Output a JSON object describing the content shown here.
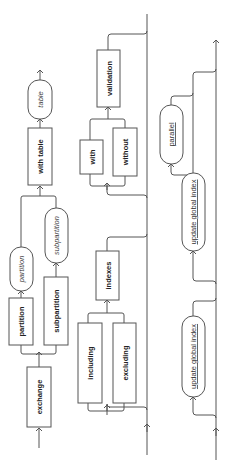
{
  "diagram": {
    "type": "syntax-railroad",
    "orientation": "rotated-90-ccw",
    "sections": [
      {
        "id": "exchange-clause",
        "nodes": [
          {
            "id": "exchange",
            "label": "exchange",
            "kind": "keyword"
          },
          {
            "id": "partition",
            "label": "partition",
            "kind": "keyword"
          },
          {
            "id": "partition-name",
            "label": "partition",
            "kind": "placeholder"
          },
          {
            "id": "subpartition",
            "label": "subpartition",
            "kind": "keyword"
          },
          {
            "id": "subpartition-name",
            "label": "subpartition",
            "kind": "placeholder"
          },
          {
            "id": "with-table",
            "label": "with table",
            "kind": "keyword"
          },
          {
            "id": "table-name",
            "label": "table",
            "kind": "placeholder"
          }
        ]
      },
      {
        "id": "index-validation-clause",
        "nodes": [
          {
            "id": "including",
            "label": "including",
            "kind": "keyword"
          },
          {
            "id": "excluding",
            "label": "excluding",
            "kind": "keyword"
          },
          {
            "id": "indexes",
            "label": "indexes",
            "kind": "keyword"
          },
          {
            "id": "with",
            "label": "with",
            "kind": "keyword"
          },
          {
            "id": "without",
            "label": "without",
            "kind": "keyword"
          },
          {
            "id": "validation",
            "label": "validation",
            "kind": "keyword"
          }
        ]
      },
      {
        "id": "global-index-clause",
        "nodes": [
          {
            "id": "update-global-index-1",
            "label": "update global index",
            "kind": "subclause"
          },
          {
            "id": "update-global-index-2",
            "label": "update global index",
            "kind": "subclause"
          },
          {
            "id": "parallel",
            "label": "parallel",
            "kind": "subclause"
          }
        ]
      }
    ]
  },
  "labels": {
    "exchange": "exchange",
    "partition_kw": "partition",
    "partition_ph": "partition",
    "subpartition_kw": "subpartition",
    "subpartition_ph": "subpartition",
    "with_table": "with table",
    "table_ph": "table",
    "including": "including",
    "excluding": "excluding",
    "indexes": "indexes",
    "with": "with",
    "without": "without",
    "validation": "validation",
    "update_global_index_1": "update global index",
    "update_global_index_2": "update global index",
    "parallel": "parallel"
  }
}
